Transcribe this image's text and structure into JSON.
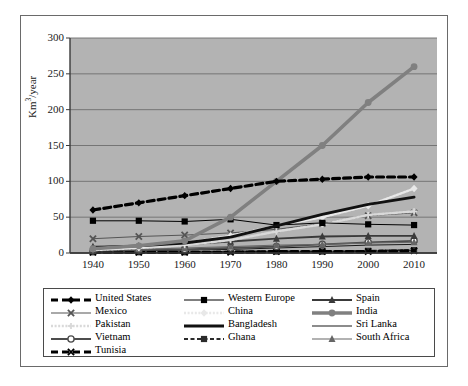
{
  "chart_data": {
    "type": "line",
    "title": "",
    "xlabel": "",
    "ylabel": "Km3/year",
    "ylabel_base": "Km",
    "ylabel_sup": "3",
    "ylabel_suffix": "/year",
    "x": [
      1940,
      1950,
      1960,
      1970,
      1980,
      1990,
      2000,
      2010
    ],
    "categories": [
      "1940",
      "1950",
      "1960",
      "1970",
      "1980",
      "1990",
      "2000",
      "2010"
    ],
    "xlim": [
      1935,
      2015
    ],
    "ylim": [
      0,
      300
    ],
    "yticks": [
      0,
      50,
      100,
      150,
      200,
      250,
      300
    ],
    "ytick_labels": [
      "0",
      "50",
      "100",
      "150",
      "200",
      "250",
      "300"
    ],
    "grid": "horizontal",
    "plot_background": "#b3b3b3",
    "legend_position": "bottom",
    "legend_columns": 3,
    "series": [
      {
        "name": "United States",
        "marker": "diamond",
        "line": "dashed-thick",
        "color": "#000000",
        "values": [
          60,
          70,
          80,
          90,
          100,
          103,
          106,
          106
        ]
      },
      {
        "name": "Western Europe",
        "marker": "square",
        "line": "thin-gray",
        "color": "#000000",
        "values": [
          45,
          45,
          44,
          47,
          39,
          42,
          40,
          39
        ]
      },
      {
        "name": "Spain",
        "marker": "triangle",
        "line": "solid-medium-gray",
        "color": "#3a3a3a",
        "values": [
          9,
          10,
          12,
          16,
          20,
          23,
          24,
          24
        ]
      },
      {
        "name": "Mexico",
        "marker": "x",
        "line": "thin-gray",
        "color": "#555555",
        "values": [
          20,
          23,
          25,
          28,
          33,
          41,
          52,
          56
        ]
      },
      {
        "name": "China",
        "marker": "diamond",
        "line": "dotted-light",
        "color": "#e8e8e8",
        "values": [
          5,
          8,
          14,
          24,
          38,
          50,
          66,
          90
        ]
      },
      {
        "name": "India",
        "marker": "circle",
        "line": "solid-thick-gray",
        "color": "#808080",
        "values": [
          6,
          10,
          17,
          50,
          100,
          150,
          210,
          260
        ]
      },
      {
        "name": "Pakistan",
        "marker": "plus",
        "line": "dotted-light",
        "color": "#d9d9d9",
        "values": [
          4,
          7,
          11,
          18,
          30,
          40,
          53,
          58
        ]
      },
      {
        "name": "Bangladesh",
        "marker": "none",
        "line": "solid-thick-black",
        "color": "#111111",
        "values": [
          7,
          10,
          14,
          22,
          38,
          54,
          68,
          78
        ]
      },
      {
        "name": "Sri Lanka",
        "marker": "none",
        "line": "solid-thin-black",
        "color": "#1a1a1a",
        "values": [
          2,
          3,
          4,
          5,
          7,
          9,
          11,
          12
        ]
      },
      {
        "name": "Vietnam",
        "marker": "circle-open",
        "line": "solid-medium",
        "color": "#4d4d4d",
        "values": [
          3,
          4,
          5,
          7,
          9,
          12,
          15,
          17
        ]
      },
      {
        "name": "Ghana",
        "marker": "square",
        "line": "dashed-small",
        "color": "#2b2b2b",
        "values": [
          1,
          1,
          1,
          2,
          2,
          2,
          3,
          4
        ]
      },
      {
        "name": "South Africa",
        "marker": "triangle",
        "line": "thin-gray",
        "color": "#666666",
        "values": [
          4,
          5,
          7,
          9,
          11,
          12,
          14,
          15
        ]
      },
      {
        "name": "Tunisia",
        "marker": "x",
        "line": "dashed-thick",
        "color": "#000000",
        "values": [
          1,
          1,
          1,
          1,
          2,
          2,
          2,
          3
        ]
      }
    ]
  },
  "legend": {
    "rows": [
      [
        {
          "label": "United States",
          "key": "united-states"
        },
        {
          "label": "Western Europe",
          "key": "western-europe"
        },
        {
          "label": "Spain",
          "key": "spain"
        }
      ],
      [
        {
          "label": "Mexico",
          "key": "mexico"
        },
        {
          "label": "China",
          "key": "china"
        },
        {
          "label": "India",
          "key": "india"
        }
      ],
      [
        {
          "label": "Pakistan",
          "key": "pakistan"
        },
        {
          "label": "Bangladesh",
          "key": "bangladesh"
        },
        {
          "label": "Sri Lanka",
          "key": "sri-lanka"
        }
      ],
      [
        {
          "label": "Vietnam",
          "key": "vietnam"
        },
        {
          "label": "Ghana",
          "key": "ghana"
        },
        {
          "label": "South Africa",
          "key": "south-africa"
        }
      ],
      [
        {
          "label": "Tunisia",
          "key": "tunisia"
        }
      ]
    ]
  }
}
